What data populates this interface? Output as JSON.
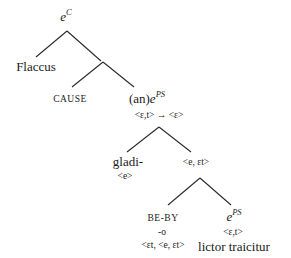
{
  "diagram": {
    "type": "syntax-tree",
    "nodes": {
      "root": {
        "base": "e",
        "sup": "C"
      },
      "flaccus": {
        "label": "Flaccus"
      },
      "cause": {
        "label": "CAUSE"
      },
      "an_eps": {
        "prefix": "(an)",
        "base": "e",
        "sup": "PS",
        "type": "<ε,t> → <ε>"
      },
      "gladi": {
        "label": "gladi-",
        "type": "<e>"
      },
      "e_et": {
        "type": "<e, εt>"
      },
      "beby": {
        "label": "BE-BY",
        "morph": "-o",
        "type": "<εt, <e, εt>"
      },
      "eps2": {
        "base": "e",
        "sup": "PS",
        "type": "<ε,t>",
        "gloss": "lictor traicitur"
      }
    },
    "edges": [
      [
        "root",
        "flaccus"
      ],
      [
        "root",
        "n1"
      ],
      [
        "n1",
        "cause"
      ],
      [
        "n1",
        "an_eps"
      ],
      [
        "an_eps",
        "gladi"
      ],
      [
        "an_eps",
        "e_et"
      ],
      [
        "e_et",
        "beby"
      ],
      [
        "e_et",
        "eps2"
      ]
    ]
  }
}
